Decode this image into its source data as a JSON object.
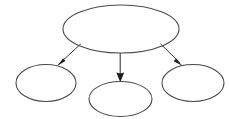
{
  "diagram": {
    "type": "node-link-tree",
    "style": "hand-drawn scanned line art",
    "background_color": "#fefefe",
    "stroke_color": "#4a4a4a",
    "arrow_color": "#2a2a2a",
    "stroke_width": 1,
    "canvas": {
      "width": 229,
      "height": 119
    },
    "nodes": [
      {
        "id": "root",
        "label": "",
        "shape": "ellipse",
        "role": "parent",
        "cx": 121,
        "cy": 29,
        "rx": 58,
        "ry": 24
      },
      {
        "id": "child-left",
        "label": "",
        "shape": "ellipse",
        "role": "child",
        "cx": 46,
        "cy": 83,
        "rx": 30,
        "ry": 18.5
      },
      {
        "id": "child-middle",
        "label": "",
        "shape": "ellipse",
        "role": "child",
        "cx": 120.5,
        "cy": 99,
        "rx": 31.5,
        "ry": 17.5
      },
      {
        "id": "child-right",
        "label": "",
        "shape": "ellipse",
        "role": "child",
        "cx": 193,
        "cy": 83,
        "rx": 31,
        "ry": 18.5
      }
    ],
    "edges": [
      {
        "id": "edge-root-left",
        "from": "root",
        "to": "child-left",
        "direction": "down-left",
        "arrowhead": "filled-triangle",
        "x1": 80,
        "y1": 44,
        "x2": 57,
        "y2": 65
      },
      {
        "id": "edge-root-middle",
        "from": "root",
        "to": "child-middle",
        "direction": "down",
        "arrowhead": "filled-triangle",
        "x1": 120,
        "y1": 53,
        "x2": 120,
        "y2": 82
      },
      {
        "id": "edge-root-right",
        "from": "root",
        "to": "child-right",
        "direction": "down-right",
        "arrowhead": "filled-triangle",
        "x1": 161,
        "y1": 44,
        "x2": 182,
        "y2": 65
      }
    ]
  }
}
